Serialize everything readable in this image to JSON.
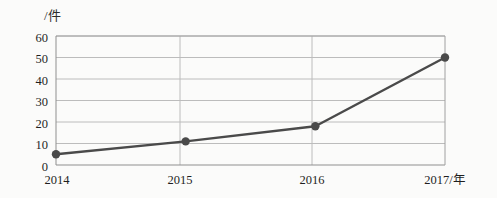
{
  "chart_data": {
    "type": "line",
    "title": "",
    "subtitle": "",
    "unit_label": "/件",
    "xlabel": "年",
    "ylabel": "",
    "categories": [
      "2014",
      "2015",
      "2016",
      "2017"
    ],
    "x_tick_labels": [
      "2014",
      "2015",
      "2016",
      "2017/年"
    ],
    "y_tick_labels": [
      "0",
      "10",
      "20",
      "30",
      "40",
      "50",
      "60"
    ],
    "y_ticks": [
      0,
      10,
      20,
      30,
      40,
      50,
      60
    ],
    "values": [
      5,
      11,
      18,
      50
    ],
    "series": [
      {
        "name": "",
        "values": [
          5,
          11,
          18,
          50
        ]
      }
    ],
    "ylim": [
      0,
      60
    ],
    "grid": true,
    "grid_x": true,
    "grid_y": true,
    "legend": false,
    "legend_position": "none",
    "marker": "circle",
    "line_color": "#4a4a4a",
    "marker_color": "#4a4a4a",
    "grid_color": "#b9b9b9",
    "axis_color": "#9a9a9a",
    "background_color": "#fbfbfa",
    "text_color": "#1f1f1f"
  },
  "yticks": [
    {
      "label": "60",
      "value": 60
    },
    {
      "label": "50",
      "value": 50
    },
    {
      "label": "40",
      "value": 40
    },
    {
      "label": "30",
      "value": 30
    },
    {
      "label": "20",
      "value": 20
    },
    {
      "label": "10",
      "value": 10
    },
    {
      "label": "0",
      "value": 0
    }
  ],
  "xticks": [
    {
      "label": "2014",
      "value": 2014
    },
    {
      "label": "2015",
      "value": 2015
    },
    {
      "label": "2016",
      "value": 2016
    },
    {
      "label": "2017/年",
      "value": 2017
    }
  ]
}
